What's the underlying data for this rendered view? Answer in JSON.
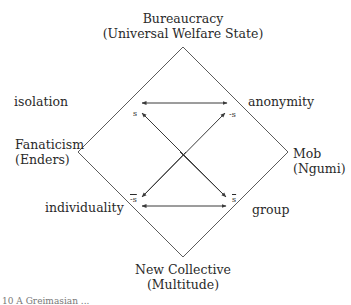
{
  "diagram": {
    "type": "semiotic-square",
    "vertices": {
      "top": {
        "line1": "Bureaucracy",
        "line2": "(Universal Welfare State)"
      },
      "left": {
        "line1": "Fanaticism",
        "line2": "(Enders)"
      },
      "right": {
        "line1": "Mob",
        "line2": "(Ngumi)"
      },
      "bottom": {
        "line1": "New Collective",
        "line2": "(Multitude)"
      }
    },
    "edge_labels": {
      "top_left": "isolation",
      "top_right": "anonymity",
      "bottom_left": "individuality",
      "bottom_right": "group"
    },
    "terms": {
      "s": "s",
      "neg_s": "-s",
      "neg_s_bar": "-s",
      "s_bar": "s"
    },
    "colors": {
      "line": "#3a3a3a",
      "text": "#2a2a2a"
    }
  },
  "caption": "10 A Greimasian ..."
}
